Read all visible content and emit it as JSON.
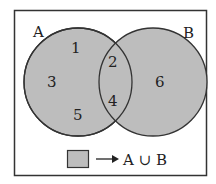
{
  "diagram": {
    "type": "venn",
    "sets": [
      {
        "name": "A",
        "label": "A",
        "only_elements": [
          "1",
          "3",
          "5"
        ]
      },
      {
        "name": "B",
        "label": "B",
        "only_elements": [
          "6"
        ]
      }
    ],
    "intersection_elements": [
      "2",
      "4"
    ],
    "region_labels": {
      "a1": "1",
      "a3": "3",
      "a5": "5",
      "i2": "2",
      "i4": "4",
      "b6": "6"
    },
    "legend": {
      "arrow": "→",
      "text": "A ∪ B"
    },
    "colors": {
      "fill": "#bdbdbd",
      "stroke": "#333333",
      "border": "#333333"
    }
  }
}
